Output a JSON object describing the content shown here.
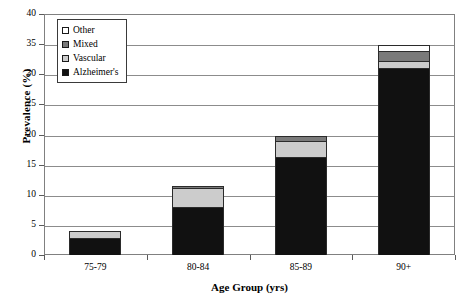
{
  "chart_data": {
    "type": "bar",
    "subtype": "stacked",
    "title": "",
    "xlabel": "Age Group (yrs)",
    "ylabel": "Prevalence (%)",
    "categories": [
      "75-79",
      "80-84",
      "85-89",
      "90+"
    ],
    "ylim": [
      0,
      40
    ],
    "yticks": [
      0,
      5,
      10,
      15,
      20,
      25,
      30,
      35,
      40
    ],
    "grid": true,
    "legend_position": "top-left",
    "series": [
      {
        "name": "Alzheimer's",
        "color": "#111111",
        "values": [
          2.8,
          8.0,
          16.3,
          31.0
        ]
      },
      {
        "name": "Vascular",
        "color": "#cccccc",
        "values": [
          1.2,
          3.2,
          2.7,
          1.2
        ]
      },
      {
        "name": "Mixed",
        "color": "#7a7a7a",
        "values": [
          0.0,
          0.2,
          0.7,
          1.6
        ]
      },
      {
        "name": "Other",
        "color": "#ffffff",
        "values": [
          0.0,
          0.0,
          0.0,
          1.0
        ]
      }
    ],
    "totals": [
      4.0,
      11.4,
      19.7,
      34.8
    ],
    "legend_order": [
      "Other",
      "Mixed",
      "Vascular",
      "Alzheimer's"
    ]
  },
  "legend": {
    "items": [
      {
        "label": "Other",
        "swatch": "#ffffff"
      },
      {
        "label": "Mixed",
        "swatch": "#7a7a7a"
      },
      {
        "label": "Vascular",
        "swatch": "#cccccc"
      },
      {
        "label": "Alzheimer's",
        "swatch": "#111111"
      }
    ]
  },
  "axes": {
    "y_title": "Prevalence (%)",
    "x_title": "Age Group (yrs)",
    "y_tick_labels": [
      "40",
      "35",
      "30",
      "25",
      "20",
      "15",
      "10",
      "5",
      "0"
    ],
    "x_tick_labels": [
      "75-79",
      "80-84",
      "85-89",
      "90+"
    ]
  }
}
